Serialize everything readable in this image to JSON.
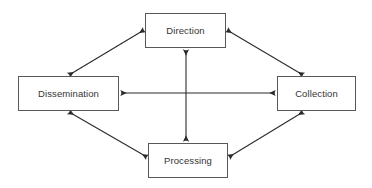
{
  "diagram": {
    "canvas": {
      "width": 372,
      "height": 188,
      "background": "#ffffff"
    },
    "style": {
      "box_border_color": "#58585a",
      "box_fill": "#ffffff",
      "arrow_color": "#2b2b2b",
      "text_color": "#333335"
    },
    "nodes": [
      {
        "id": "direction",
        "label": "Direction",
        "x": 145,
        "y": 13,
        "width": 81,
        "height": 35
      },
      {
        "id": "collection",
        "label": "Collection",
        "x": 277,
        "y": 76,
        "width": 79,
        "height": 35
      },
      {
        "id": "processing",
        "label": "Processing",
        "x": 148,
        "y": 143,
        "width": 80,
        "height": 35
      },
      {
        "id": "dissemination",
        "label": "Dissemination",
        "x": 18,
        "y": 76,
        "width": 101,
        "height": 35
      }
    ],
    "edges": [
      {
        "id": "dissemination-direction",
        "from": "dissemination",
        "to": "direction",
        "kind": "diagonal",
        "arrowheads": "both",
        "x1": 69,
        "y1": 75,
        "x2": 144,
        "y2": 30
      },
      {
        "id": "direction-collection",
        "from": "direction",
        "to": "collection",
        "kind": "diagonal",
        "arrowheads": "both",
        "x1": 227,
        "y1": 30,
        "x2": 303,
        "y2": 75
      },
      {
        "id": "collection-processing",
        "from": "collection",
        "to": "processing",
        "kind": "diagonal",
        "arrowheads": "both",
        "x1": 303,
        "y1": 112,
        "x2": 229,
        "y2": 157
      },
      {
        "id": "processing-dissemination",
        "from": "processing",
        "to": "dissemination",
        "kind": "diagonal",
        "arrowheads": "both",
        "x1": 147,
        "y1": 157,
        "x2": 69,
        "y2": 112
      },
      {
        "id": "dissemination-collection",
        "from": "dissemination",
        "to": "collection",
        "kind": "horizontal",
        "arrowheads": "both",
        "x1": 120,
        "y1": 93,
        "x2": 276,
        "y2": 93
      },
      {
        "id": "direction-processing",
        "from": "direction",
        "to": "processing",
        "kind": "vertical",
        "arrowheads": "both",
        "x1": 186,
        "y1": 49,
        "x2": 186,
        "y2": 142
      }
    ]
  }
}
